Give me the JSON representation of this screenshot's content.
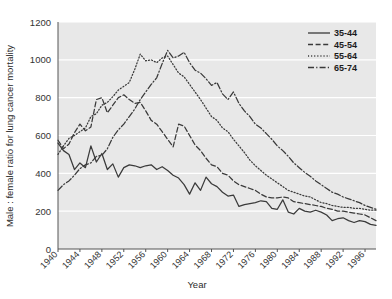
{
  "chart_data": {
    "type": "line",
    "title": "",
    "xlabel": "Year",
    "ylabel": "Male : female ratio for lung cancer mortality",
    "xlim": [
      1940,
      1998
    ],
    "ylim": [
      0,
      1200
    ],
    "ytick_labels": [
      "0",
      "200",
      "400",
      "600",
      "800",
      "1000",
      "1200"
    ],
    "yticks": [
      0,
      200,
      400,
      600,
      800,
      1000,
      1200
    ],
    "xtick_labels": [
      "1940",
      "1944",
      "1948",
      "1952",
      "1956",
      "1960",
      "1964",
      "1968",
      "1972",
      "1976",
      "1980",
      "1984",
      "1988",
      "1992",
      "1996"
    ],
    "xticks": [
      1940,
      1944,
      1948,
      1952,
      1956,
      1960,
      1964,
      1968,
      1972,
      1976,
      1980,
      1984,
      1988,
      1992,
      1996
    ],
    "grid": "horizontal-white",
    "legend_position": "top-right",
    "plot_background": "#e8e8e8",
    "line_color": "#3a3a3a",
    "grid_color": "#ffffff",
    "x": [
      1940,
      1941,
      1942,
      1943,
      1944,
      1945,
      1946,
      1947,
      1948,
      1949,
      1950,
      1951,
      1952,
      1953,
      1954,
      1955,
      1956,
      1957,
      1958,
      1959,
      1960,
      1961,
      1962,
      1963,
      1964,
      1965,
      1966,
      1967,
      1968,
      1969,
      1970,
      1971,
      1972,
      1973,
      1974,
      1975,
      1976,
      1977,
      1978,
      1979,
      1980,
      1981,
      1982,
      1983,
      1984,
      1985,
      1986,
      1987,
      1988,
      1989,
      1990,
      1991,
      1992,
      1993,
      1994,
      1995,
      1996,
      1997,
      1998
    ],
    "series": [
      {
        "name": "35-44",
        "dash": "solid",
        "values": [
          560,
          520,
          500,
          420,
          455,
          430,
          545,
          460,
          505,
          420,
          450,
          380,
          430,
          445,
          440,
          430,
          440,
          445,
          420,
          435,
          415,
          390,
          375,
          340,
          290,
          350,
          310,
          380,
          345,
          330,
          300,
          280,
          285,
          225,
          235,
          240,
          245,
          255,
          250,
          215,
          210,
          260,
          195,
          185,
          215,
          200,
          195,
          205,
          195,
          180,
          150,
          160,
          165,
          150,
          140,
          150,
          145,
          130,
          125
        ]
      },
      {
        "name": "45-54",
        "dash": "dashed",
        "values": [
          575,
          530,
          555,
          615,
          660,
          625,
          645,
          790,
          800,
          720,
          760,
          800,
          815,
          790,
          770,
          775,
          730,
          680,
          660,
          620,
          580,
          540,
          660,
          650,
          600,
          550,
          520,
          480,
          445,
          435,
          400,
          390,
          360,
          340,
          330,
          320,
          310,
          290,
          275,
          270,
          270,
          275,
          270,
          250,
          245,
          240,
          235,
          230,
          225,
          215,
          210,
          200,
          200,
          195,
          190,
          185,
          180,
          165,
          150
        ]
      },
      {
        "name": "55-64",
        "dash": "dotted",
        "values": [
          500,
          545,
          585,
          600,
          620,
          640,
          700,
          715,
          760,
          775,
          805,
          840,
          860,
          880,
          950,
          1030,
          995,
          1000,
          985,
          1010,
          1020,
          975,
          930,
          910,
          870,
          830,
          790,
          745,
          700,
          680,
          640,
          620,
          580,
          545,
          510,
          470,
          440,
          415,
          390,
          370,
          350,
          330,
          310,
          300,
          290,
          280,
          275,
          260,
          245,
          240,
          230,
          225,
          220,
          220,
          215,
          215,
          210,
          205,
          205
        ]
      },
      {
        "name": "65-74",
        "dash": "dashdot",
        "values": [
          310,
          340,
          360,
          390,
          425,
          445,
          455,
          490,
          495,
          530,
          590,
          630,
          660,
          700,
          740,
          790,
          830,
          870,
          905,
          980,
          1050,
          1010,
          1020,
          1040,
          985,
          945,
          930,
          900,
          865,
          880,
          820,
          790,
          830,
          770,
          730,
          700,
          660,
          640,
          610,
          580,
          545,
          520,
          490,
          455,
          430,
          405,
          385,
          360,
          340,
          320,
          300,
          290,
          275,
          265,
          255,
          245,
          230,
          220,
          210
        ]
      }
    ]
  },
  "legend": {
    "items": [
      {
        "label": "35-44",
        "dash": "solid"
      },
      {
        "label": "45-54",
        "dash": "dashed"
      },
      {
        "label": "55-64",
        "dash": "dotted"
      },
      {
        "label": "65-74",
        "dash": "dashdot"
      }
    ]
  }
}
